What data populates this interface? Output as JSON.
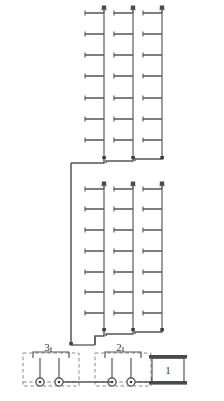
{
  "diagram": {
    "background_color": "#ffffff",
    "line_color": "#555555",
    "dashed_color": "#777777",
    "label_color": "#3a3a3a",
    "caption": "",
    "groups": [
      {
        "id": "upper-group",
        "name": "Upper Floor Group",
        "riser_count": 3,
        "branch_count": 7,
        "risers": [
          {
            "id": "upper-riser-1",
            "label": "",
            "x": 104,
            "top": 12,
            "bottom": 160,
            "cap": "valve-cap"
          },
          {
            "id": "upper-riser-2",
            "label": "",
            "x": 133,
            "top": 12,
            "bottom": 160,
            "cap": "valve-cap"
          },
          {
            "id": "upper-riser-3",
            "label": "",
            "x": 162,
            "top": 12,
            "bottom": 160,
            "cap": "valve-cap"
          }
        ],
        "branch_levels": [
          12,
          34,
          55,
          76,
          98,
          119,
          140
        ]
      },
      {
        "id": "lower-group",
        "name": "Lower Floor Group",
        "riser_count": 3,
        "branch_count": 7,
        "risers": [
          {
            "id": "lower-riser-1",
            "label": "",
            "x": 104,
            "top": 188,
            "bottom": 330,
            "cap": "valve-cap"
          },
          {
            "id": "lower-riser-2",
            "label": "",
            "x": 133,
            "top": 188,
            "bottom": 330,
            "cap": "valve-cap"
          },
          {
            "id": "lower-riser-3",
            "label": "",
            "x": 162,
            "top": 188,
            "bottom": 330,
            "cap": "valve-cap"
          }
        ],
        "branch_levels": [
          188,
          209,
          230,
          251,
          272,
          292,
          313
        ]
      }
    ],
    "equipment": [
      {
        "id": "unit-3",
        "label": "3",
        "type": "pump-station",
        "outline": "dashed",
        "pump_count": 2
      },
      {
        "id": "unit-2",
        "label": "2",
        "type": "pump-station",
        "outline": "dashed",
        "pump_count": 2
      },
      {
        "id": "unit-1",
        "label": "1",
        "type": "tank",
        "outline": "solid",
        "pump_count": 0
      }
    ]
  }
}
